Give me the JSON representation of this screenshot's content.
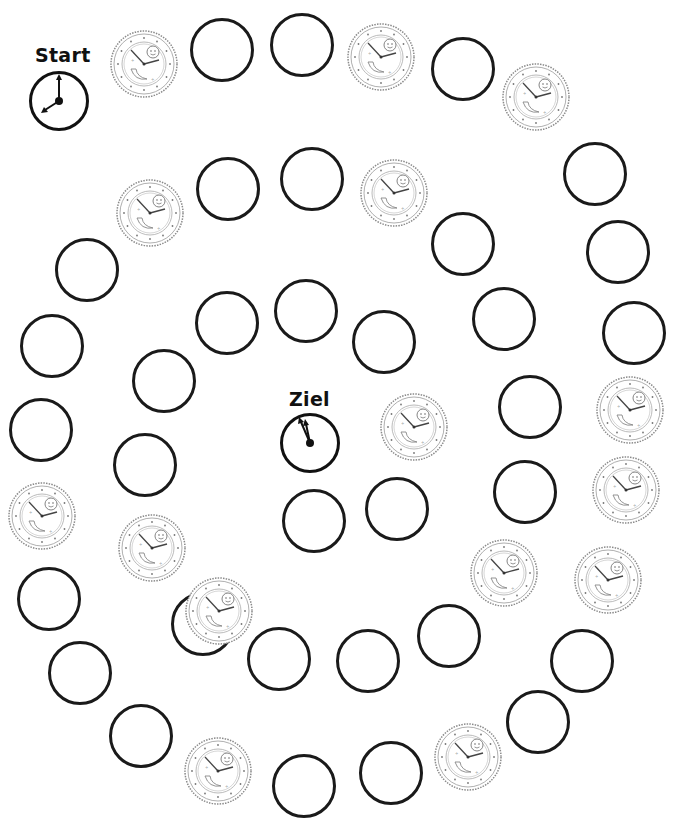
{
  "game": {
    "title": "Uhren-Spiel",
    "start_label": "Start",
    "goal_label": "Ziel",
    "start_clock": {
      "hour_hand": "8",
      "minute_hand": "12",
      "time": "8:00"
    },
    "goal_clock": {
      "hour_hand": "11",
      "minute_hand": "12",
      "time": "11:55"
    },
    "space_types": {
      "empty": "empty-space",
      "clock": "clock-picture-space"
    },
    "spaces": [
      "clock",
      "empty",
      "empty",
      "clock",
      "empty",
      "clock",
      "empty",
      "empty",
      "empty",
      "clock",
      "clock",
      "clock",
      "empty",
      "empty",
      "clock",
      "empty",
      "empty",
      "clock",
      "empty",
      "empty",
      "empty",
      "clock",
      "empty",
      "empty",
      "empty",
      "clock",
      "empty",
      "empty",
      "clock",
      "empty",
      "empty",
      "empty",
      "empty",
      "clock",
      "empty",
      "empty",
      "empty",
      "empty",
      "clock",
      "empty",
      "empty",
      "empty",
      "empty",
      "empty",
      "clock",
      "empty",
      "empty",
      "clock",
      "empty",
      "empty",
      "clock",
      "empty",
      "clock",
      "empty"
    ],
    "colors": {
      "ink": "#1a1a1a",
      "clock_gray": "#7a7a7a",
      "background": "#ffffff"
    }
  }
}
